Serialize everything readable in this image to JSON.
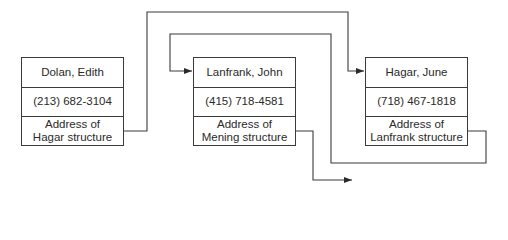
{
  "diagram": {
    "type": "linked-list",
    "records": [
      {
        "id": "dolan",
        "name": "Dolan, Edith",
        "phone": "(213) 682-3104",
        "pointer_line1": "Address of",
        "pointer_line2": "Hagar structure"
      },
      {
        "id": "lanfrank",
        "name": "Lanfrank, John",
        "phone": "(415) 718-4581",
        "pointer_line1": "Address of",
        "pointer_line2": "Mening structure"
      },
      {
        "id": "hagar",
        "name": "Hagar, June",
        "phone": "(718) 467-1818",
        "pointer_line1": "Address of",
        "pointer_line2": "Lanfrank structure"
      }
    ],
    "links": [
      {
        "from": "dolan",
        "to": "hagar"
      },
      {
        "from": "hagar",
        "to": "lanfrank"
      },
      {
        "from": "lanfrank",
        "to": "mening (off-diagram)"
      }
    ],
    "colors": {
      "line": "#3a3a3a",
      "background": "#ffffff"
    }
  }
}
